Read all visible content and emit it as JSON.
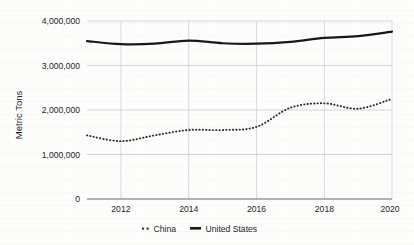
{
  "chart_data": {
    "type": "line",
    "title": "",
    "xlabel": "",
    "ylabel": "Metric Tons",
    "x": [
      2011,
      2012,
      2013,
      2014,
      2015,
      2016,
      2017,
      2018,
      2019,
      2020
    ],
    "xlim": [
      2011,
      2020
    ],
    "ylim": [
      0,
      4000000
    ],
    "grid": true,
    "legend_position": "bottom-center",
    "y_ticks": [
      0,
      1000000,
      2000000,
      3000000,
      4000000
    ],
    "y_tick_labels": [
      "0",
      "1,000,000",
      "2,000,000",
      "3,000,000",
      "4,000,000"
    ],
    "x_ticks": [
      2012,
      2014,
      2016,
      2018,
      2020
    ],
    "x_tick_labels": [
      "2012",
      "2014",
      "2016",
      "2018",
      "2020"
    ],
    "series": [
      {
        "name": "China",
        "style": "dotted",
        "color": "#2b2b2b",
        "values": [
          1430000,
          1300000,
          1430000,
          1550000,
          1550000,
          1620000,
          2050000,
          2150000,
          2030000,
          2250000
        ]
      },
      {
        "name": "United States",
        "style": "solid",
        "color": "#181818",
        "values": [
          3550000,
          3480000,
          3490000,
          3560000,
          3500000,
          3490000,
          3530000,
          3620000,
          3660000,
          3760000
        ]
      }
    ]
  },
  "legend": {
    "items": [
      {
        "label": "China",
        "marker": "dotted-marker"
      },
      {
        "label": "United States",
        "marker": "solid-marker"
      }
    ]
  },
  "axes": {
    "y_axis_title": "Metric Tons"
  }
}
